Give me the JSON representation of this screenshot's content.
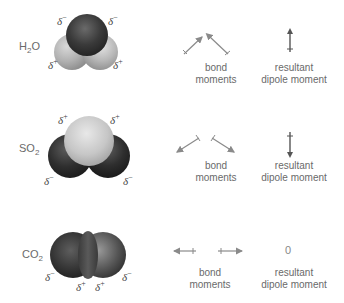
{
  "molecules": [
    {
      "formula_main": "H",
      "formula_sub": "2",
      "formula_end": "O",
      "charges": {
        "top_left": {
          "delta": "δ",
          "sign": "−"
        },
        "top_right": {
          "delta": "δ",
          "sign": "−"
        },
        "bottom_left": {
          "delta": "δ",
          "sign": "+"
        },
        "bottom_right": {
          "delta": "δ",
          "sign": "+"
        }
      },
      "bond_moments_label_1": "bond",
      "bond_moments_label_2": "moments",
      "resultant_label_1": "resultant",
      "resultant_label_2": "dipole moment",
      "resultant_value": ""
    },
    {
      "formula_main": "SO",
      "formula_sub": "2",
      "formula_end": "",
      "charges": {
        "top_left": {
          "delta": "δ",
          "sign": "+"
        },
        "top_right": {
          "delta": "δ",
          "sign": "+"
        },
        "bottom_left": {
          "delta": "δ",
          "sign": "−"
        },
        "bottom_right": {
          "delta": "δ",
          "sign": "−"
        }
      },
      "bond_moments_label_1": "bond",
      "bond_moments_label_2": "moments",
      "resultant_label_1": "resultant",
      "resultant_label_2": "dipole moment",
      "resultant_value": ""
    },
    {
      "formula_main": "CO",
      "formula_sub": "2",
      "formula_end": "",
      "charges": {
        "left": {
          "delta": "δ",
          "sign": "−"
        },
        "right": {
          "delta": "δ",
          "sign": "−"
        },
        "center_left": {
          "delta": "δ",
          "sign": "+"
        },
        "center_right": {
          "delta": "δ",
          "sign": "+"
        }
      },
      "bond_moments_label_1": "bond",
      "bond_moments_label_2": "moments",
      "resultant_label_1": "resultant",
      "resultant_label_2": "dipole moment",
      "resultant_value": "0"
    }
  ],
  "colors": {
    "arrow": "#8a8a8a",
    "resultant_arrow": "#555555",
    "text": "#6a6a6a"
  }
}
